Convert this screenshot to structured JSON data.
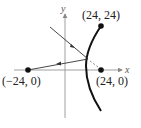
{
  "figure": {
    "axes": {
      "x_label": "x",
      "y_label": "y"
    },
    "points": [
      {
        "label": "(24, 24)",
        "x": 24,
        "y": 24
      },
      {
        "label": "(−24, 0)",
        "x": -24,
        "y": 0
      },
      {
        "label": "(24, 0)",
        "x": 24,
        "y": 0
      }
    ],
    "curve": "hyperbola branch through (24, 24)",
    "rays": [
      {
        "name": "incoming",
        "direction": "toward focus (24, 0), reflected at curve"
      },
      {
        "name": "reflected",
        "direction": "toward (−24, 0)"
      }
    ],
    "colors": {
      "curve": "#111111",
      "axes": "#888888",
      "rays": "#333333"
    }
  }
}
